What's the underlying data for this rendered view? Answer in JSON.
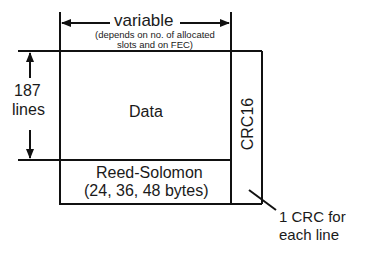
{
  "diagram": {
    "width_label": "variable",
    "width_note_line1": "(depends on no. of allocated",
    "width_note_line2": "slots and on FEC)",
    "height_label_line1": "187",
    "height_label_line2": "lines",
    "data_block": "Data",
    "crc_block": "CRC16",
    "rs_block_line1": "Reed-Solomon",
    "rs_block_line2": "(24, 36, 48 bytes)",
    "crc_note_line1": "1 CRC for",
    "crc_note_line2": "each line"
  },
  "colors": {
    "line": "#111111",
    "background": "#ffffff"
  }
}
